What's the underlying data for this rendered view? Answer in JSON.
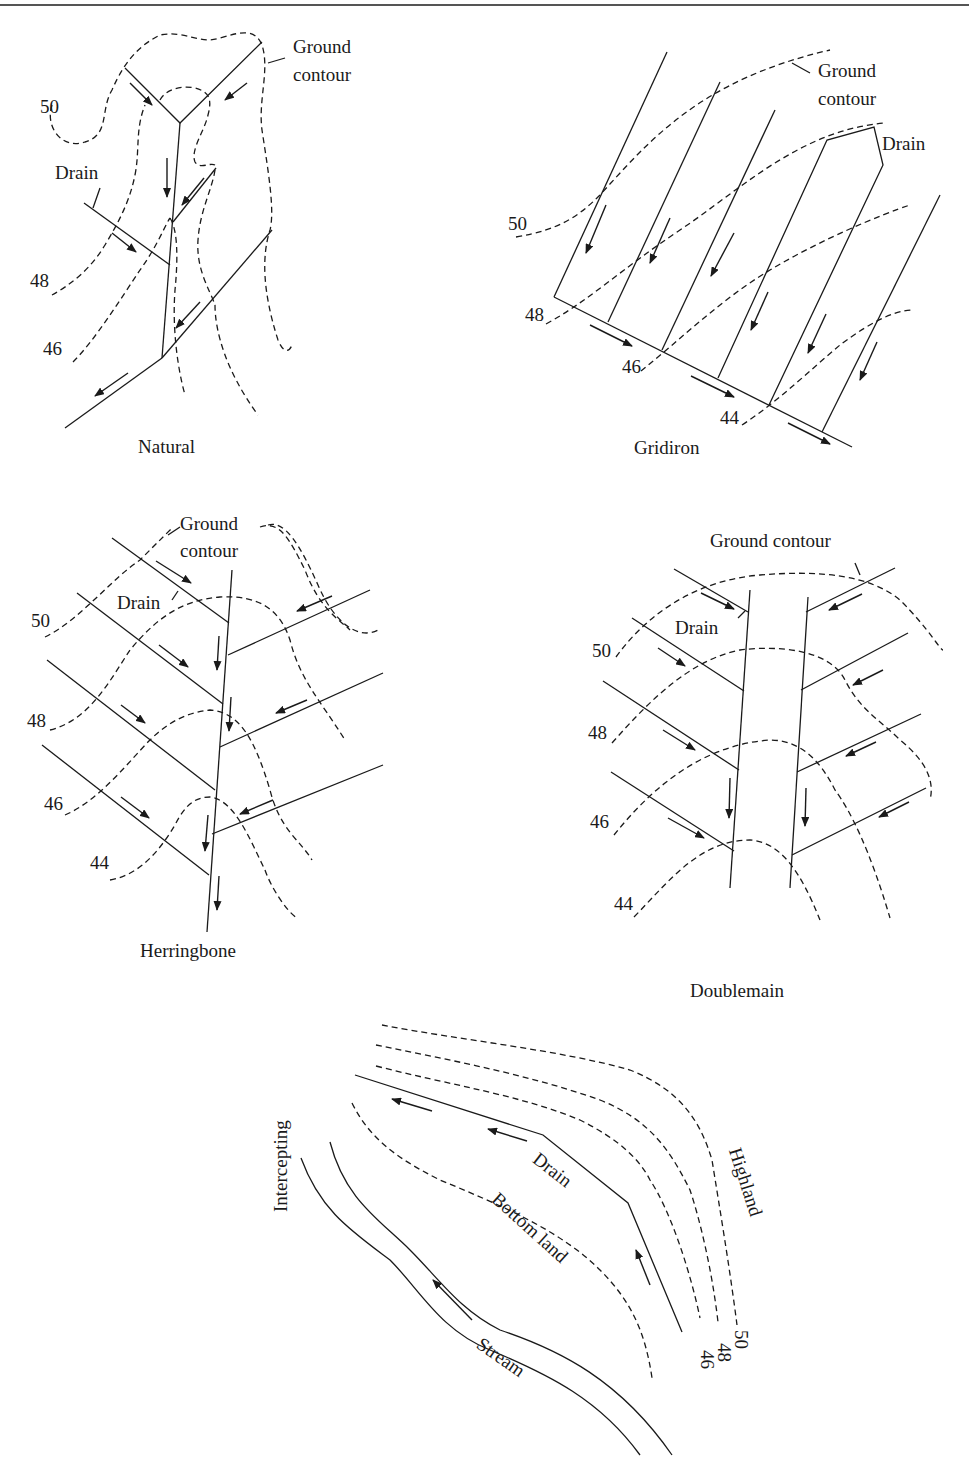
{
  "diagrams": [
    {
      "id": "natural",
      "title": "Natural",
      "labels": {
        "ground_contour_1": "Ground",
        "ground_contour_2": "contour",
        "drain": "Drain"
      },
      "contours": [
        "50",
        "48",
        "46"
      ]
    },
    {
      "id": "gridiron",
      "title": "Gridiron",
      "labels": {
        "ground_contour_1": "Ground",
        "ground_contour_2": "contour",
        "drain": "Drain"
      },
      "contours": [
        "50",
        "48",
        "46",
        "44"
      ]
    },
    {
      "id": "herringbone",
      "title": "Herringbone",
      "labels": {
        "ground_contour_1": "Ground",
        "ground_contour_2": "contour",
        "drain": "Drain"
      },
      "contours": [
        "50",
        "48",
        "46",
        "44"
      ]
    },
    {
      "id": "doublemain",
      "title": "Doublemain",
      "labels": {
        "ground_contour": "Ground contour",
        "drain": "Drain"
      },
      "contours": [
        "50",
        "48",
        "46",
        "44"
      ]
    },
    {
      "id": "intercepting",
      "title": "Intercepting",
      "labels": {
        "drain": "Drain",
        "bottom_land": "Bottom land",
        "highland": "Highland",
        "stream": "Stream"
      },
      "contours": [
        "50",
        "48",
        "46"
      ]
    }
  ],
  "colors": {
    "line": "#1a1a1a",
    "background": "#ffffff"
  }
}
